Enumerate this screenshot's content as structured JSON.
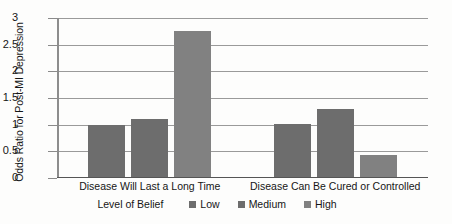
{
  "chart_data": {
    "type": "bar",
    "title": "",
    "subtitle": "",
    "xlabel": "",
    "ylabel": "Odds Ratio for Post-MI Depression",
    "ylim": [
      0,
      3
    ],
    "yticks": [
      "0",
      "0.5",
      "1",
      "1.5",
      "2",
      "2.5",
      "3"
    ],
    "ytick_values": [
      0,
      0.5,
      1,
      1.5,
      2,
      2.5,
      3
    ],
    "grid": "horizontal",
    "legend_position": "bottom",
    "legend_title": "Level of Belief",
    "categories": [
      "Disease Will Last a Long Time",
      "Disease Can Be Cured or Controlled"
    ],
    "series": [
      {
        "name": "Low",
        "color": "#6d6d6d",
        "values": [
          0.98,
          1.0
        ]
      },
      {
        "name": "Medium",
        "color": "#6d6d6d",
        "values": [
          1.08,
          1.27
        ]
      },
      {
        "name": "High",
        "color": "#818181",
        "values": [
          2.73,
          0.42
        ]
      }
    ]
  },
  "axis": {
    "y_title": "Odds Ratio for Post-MI Depression",
    "ticks": [
      {
        "label": "3"
      },
      {
        "label": "2.5"
      },
      {
        "label": "2"
      },
      {
        "label": "1.5"
      },
      {
        "label": "1"
      },
      {
        "label": "0.5"
      },
      {
        "label": "0"
      }
    ]
  },
  "categories": [
    {
      "label": "Disease Will Last a Long Time"
    },
    {
      "label": "Disease Can Be Cured or Controlled"
    }
  ],
  "legend": {
    "title": "Level of Belief",
    "entries": [
      {
        "label": "Low"
      },
      {
        "label": "Medium"
      },
      {
        "label": "High"
      }
    ]
  }
}
